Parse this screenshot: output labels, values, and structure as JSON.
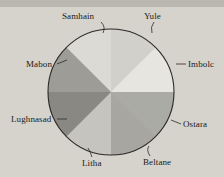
{
  "figure": {
    "background_color": "#d5d3cc",
    "band_color": "#b9b7b0"
  },
  "chart_data": {
    "type": "pie",
    "title": "",
    "subtitle": "",
    "xlabel": "",
    "ylabel": "",
    "legend_position": "outside-labels",
    "grid": false,
    "start_angle_deg": 90,
    "direction": "clockwise",
    "center": {
      "x": 111,
      "y": 92
    },
    "radius": 63,
    "outline_color": "#2b2926",
    "categories": [
      "Samhain",
      "Yule",
      "Imbolc",
      "Ostara",
      "Beltane",
      "Litha",
      "Lughnasad",
      "Mabon"
    ],
    "values": [
      12.5,
      12.5,
      12.5,
      12.5,
      12.5,
      12.5,
      12.5,
      12.5
    ],
    "slices": [
      {
        "label": "Samhain",
        "value": 12.5,
        "color": "#dcdad4",
        "label_x": 62,
        "label_y": 11,
        "leader": true
      },
      {
        "label": "Yule",
        "value": 12.5,
        "color": "#d2d0ca",
        "label_x": 144,
        "label_y": 11,
        "leader": true
      },
      {
        "label": "Imbolc",
        "value": 12.5,
        "color": "#e7e5df",
        "label_x": 188,
        "label_y": 59,
        "leader": true
      },
      {
        "label": "Ostara",
        "value": 12.5,
        "color": "#ababa6",
        "label_x": 183,
        "label_y": 119,
        "leader": true
      },
      {
        "label": "Beltane",
        "value": 12.5,
        "color": "#a8a6a1",
        "label_x": 143,
        "label_y": 157,
        "leader": true
      },
      {
        "label": "Litha",
        "value": 12.5,
        "color": "#c6c4be",
        "label_x": 82,
        "label_y": 158,
        "leader": true
      },
      {
        "label": "Lughnasad",
        "value": 12.5,
        "color": "#8a8883",
        "label_x": 11,
        "label_y": 114,
        "leader": true
      },
      {
        "label": "Mabon",
        "value": 12.5,
        "color": "#9e9c97",
        "label_x": 26,
        "label_y": 59,
        "leader": true
      }
    ]
  },
  "labels": {
    "samhain": "Samhain",
    "yule": "Yule",
    "imbolc": "Imbolc",
    "ostara": "Ostara",
    "beltane": "Beltane",
    "litha": "Litha",
    "lughnasad": "Lughnasad",
    "mabon": "Mabon"
  }
}
